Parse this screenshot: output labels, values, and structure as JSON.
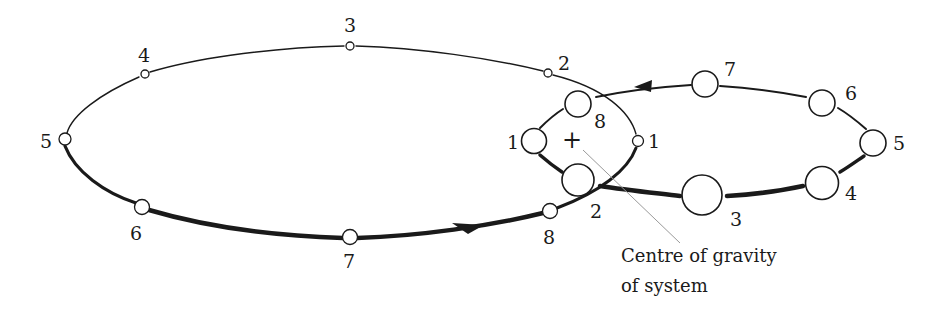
{
  "diagram": {
    "colors": {
      "ink": "#1a1a1a",
      "leader": "#9a9a9a",
      "background": "#ffffff"
    },
    "centre_marker": {
      "symbol": "+",
      "x": 572,
      "y": 141
    },
    "caption": {
      "line1": "Centre of gravity",
      "line2": "of system"
    },
    "large_orbit": {
      "description": "Orbit of smaller star (small circles)",
      "positions": [
        {
          "label": "1",
          "x": 638,
          "y": 141
        },
        {
          "label": "2",
          "x": 548,
          "y": 73
        },
        {
          "label": "3",
          "x": 350,
          "y": 46
        },
        {
          "label": "4",
          "x": 145,
          "y": 74
        },
        {
          "label": "5",
          "x": 65,
          "y": 139
        },
        {
          "label": "6",
          "x": 142,
          "y": 207
        },
        {
          "label": "7",
          "x": 350,
          "y": 237
        },
        {
          "label": "8",
          "x": 550,
          "y": 211
        }
      ]
    },
    "small_orbit": {
      "description": "Orbit of larger star (large circles)",
      "positions": [
        {
          "label": "1",
          "x": 534,
          "y": 141
        },
        {
          "label": "2",
          "x": 578,
          "y": 180
        },
        {
          "label": "3",
          "x": 702,
          "y": 195
        },
        {
          "label": "4",
          "x": 822,
          "y": 183
        },
        {
          "label": "5",
          "x": 873,
          "y": 143
        },
        {
          "label": "6",
          "x": 822,
          "y": 103
        },
        {
          "label": "7",
          "x": 705,
          "y": 84
        },
        {
          "label": "8",
          "x": 578,
          "y": 104
        }
      ]
    }
  }
}
